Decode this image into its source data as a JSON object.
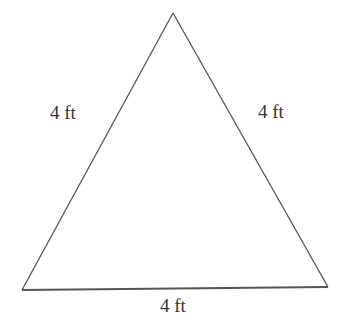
{
  "diagram": {
    "shape": "equilateral-triangle",
    "stroke_color": "#555555",
    "fill_color": "#ffffff",
    "vertices": {
      "apex": [
        173,
        13
      ],
      "bottom_left": [
        22,
        290
      ],
      "bottom_right": [
        328,
        287
      ]
    },
    "labels": {
      "left_side": "4 ft",
      "right_side": "4 ft",
      "bottom_side": "4 ft"
    }
  }
}
